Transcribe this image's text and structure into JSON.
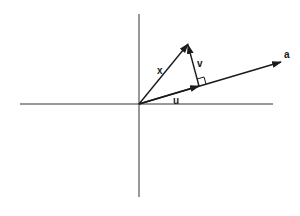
{
  "diagram": {
    "title": "",
    "labels": {
      "x": "x",
      "v": "v",
      "u": "u",
      "a": "a"
    },
    "colors": {
      "ink": "#1a1a1a",
      "background": "#ffffff"
    },
    "elements": [
      {
        "id": "horizontal-axis",
        "type": "axis"
      },
      {
        "id": "vertical-axis",
        "type": "axis"
      },
      {
        "id": "vector-x",
        "label": "x",
        "from": "origin",
        "to": "tip-x"
      },
      {
        "id": "vector-a",
        "label": "a",
        "from": "origin",
        "to": "tip-a"
      },
      {
        "id": "vector-u",
        "label": "u",
        "from": "origin",
        "to": "foot"
      },
      {
        "id": "vector-v",
        "label": "v",
        "from": "foot",
        "to": "tip-x"
      },
      {
        "id": "right-angle-marker",
        "at": "foot"
      }
    ]
  }
}
